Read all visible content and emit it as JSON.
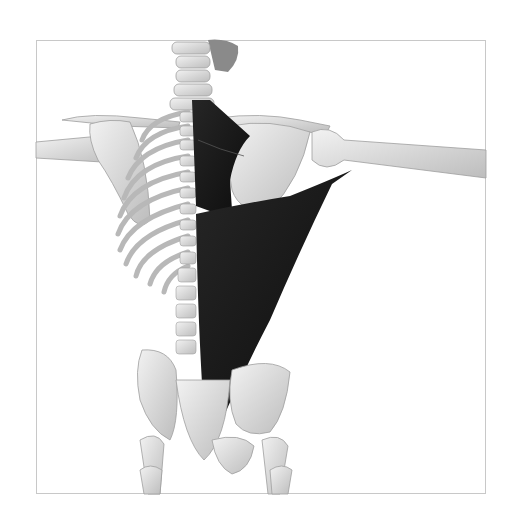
{
  "figure": {
    "highlighted_structures": [
      "trapezius-lower-fibers",
      "latissimus-dorsi"
    ],
    "colors": {
      "bone": "#e6e6e6",
      "bone_shadow": "#b4b4b4",
      "muscle": "#1a1a1a",
      "frame_border": "#c8c8c8",
      "background": "#ffffff"
    },
    "caption": ""
  }
}
